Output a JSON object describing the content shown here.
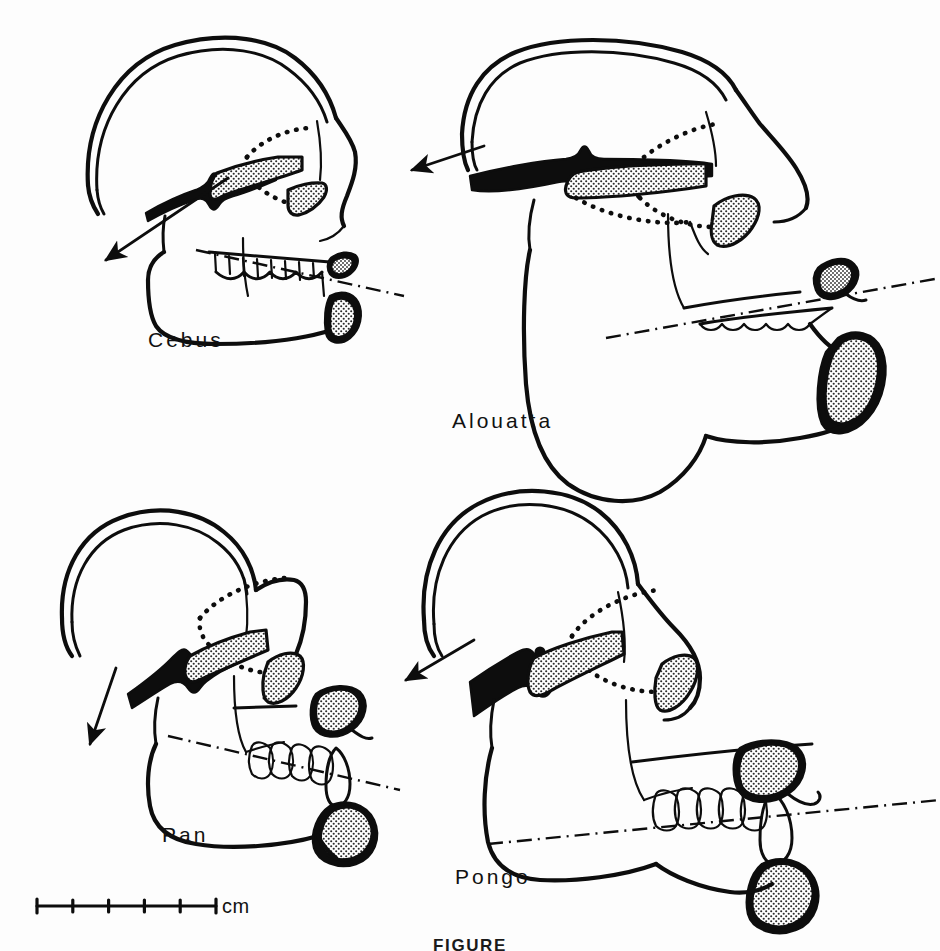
{
  "figure": {
    "caption": "FIGURE",
    "background_color": "#fdfdfd",
    "ink_color": "#0d0d0d",
    "stipple_color": "#4a4a4a"
  },
  "scale_bar": {
    "unit_label": "cm",
    "tick_count": 6,
    "interval_count": 5,
    "x_start_px": 37,
    "x_end_px": 216,
    "y_px": 906
  },
  "panels": [
    {
      "id": "cebus",
      "label": "Cebus",
      "label_x": 148,
      "label_y": 328,
      "arrow_direction": "down-left",
      "arrow_from": [
        228,
        178
      ],
      "arrow_to": [
        104,
        262
      ],
      "occlusal_plane": "dash-dot",
      "features": [
        "cranial vault",
        "temporal suture dots",
        "stippled palate",
        "zygomatic arch",
        "mandible",
        "tooth row",
        "stippled incisors",
        "stippled canine"
      ]
    },
    {
      "id": "alouatta",
      "label": "Alouatta",
      "label_x": 452,
      "label_y": 409,
      "arrow_direction": "left",
      "arrow_from": [
        483,
        146
      ],
      "arrow_to": [
        410,
        171
      ],
      "occlusal_plane": "dash-dot",
      "features": [
        "reduced cranial vault",
        "temporal suture dots",
        "stippled palate",
        "zygomatic arch",
        "deep expanded mandible",
        "tooth row",
        "stippled incisors",
        "large stippled gonial region"
      ]
    },
    {
      "id": "pan",
      "label": "Pan",
      "label_x": 162,
      "label_y": 823,
      "arrow_direction": "down-left",
      "arrow_from": [
        115,
        668
      ],
      "arrow_to": [
        90,
        742
      ],
      "occlusal_plane": "dash-dot",
      "features": [
        "cranial vault",
        "temporal suture dots",
        "heavy stippled palate",
        "zygomatic arch",
        "mandible",
        "molar row",
        "projecting canine",
        "stippled upper incisors",
        "stippled lower incisors"
      ]
    },
    {
      "id": "pongo",
      "label": "Pongo",
      "label_x": 455,
      "label_y": 865,
      "arrow_direction": "down-left",
      "arrow_from": [
        472,
        641
      ],
      "arrow_to": [
        404,
        680
      ],
      "occlusal_plane": "dash-dot",
      "features": [
        "cranial vault",
        "temporal suture dots",
        "large stippled palate",
        "zygomatic arch",
        "deep mandible",
        "molar row",
        "projecting canine",
        "stippled upper incisors",
        "stippled lower incisors"
      ]
    }
  ]
}
